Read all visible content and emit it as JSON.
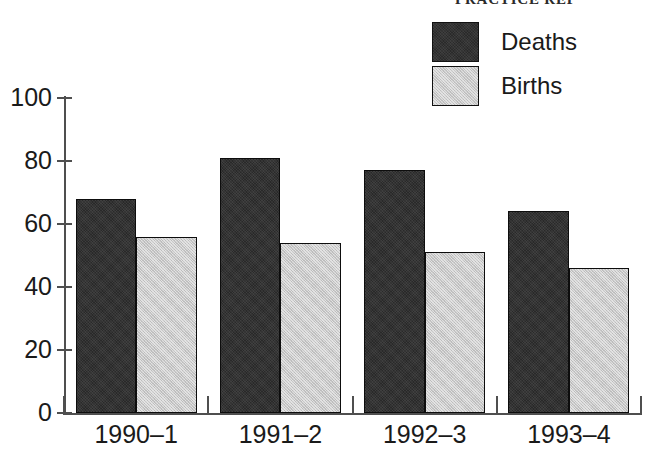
{
  "page": {
    "running_head": "PRACTICE REP",
    "background_color": "#ffffff"
  },
  "legend": {
    "position": "top-right",
    "entries": [
      {
        "label": "Deaths",
        "color": "#333333",
        "swatch_icon": "filled-square-dark"
      },
      {
        "label": "Births",
        "color": "#c8c8c8",
        "swatch_icon": "filled-square-light"
      }
    ]
  },
  "chart_data": {
    "type": "bar",
    "title": "",
    "subtitle": "",
    "xlabel": "",
    "ylabel": "",
    "categories": [
      "1990–1",
      "1991–2",
      "1992–3",
      "1993–4"
    ],
    "series": [
      {
        "name": "Deaths",
        "color": "#333333",
        "values": [
          68,
          81,
          77,
          64
        ]
      },
      {
        "name": "Births",
        "color": "#c8c8c8",
        "values": [
          56,
          54,
          51,
          46
        ]
      }
    ],
    "ylim": [
      0,
      100
    ],
    "yticks": [
      0,
      20,
      40,
      60,
      80,
      100
    ],
    "ytick_labels": [
      "0",
      "20",
      "40",
      "60",
      "80",
      "100"
    ],
    "xlim_groups": 4,
    "grid": false,
    "legend_position": "top-right",
    "annotations": []
  }
}
